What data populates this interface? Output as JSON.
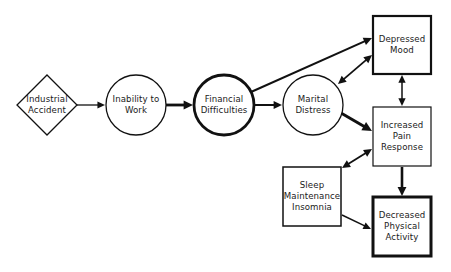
{
  "diagram": {
    "nodes": [
      {
        "id": "industrial-accident",
        "shape": "diamond",
        "lines": [
          "Industrial",
          "Accident"
        ],
        "cx": 47,
        "cy": 105,
        "w": 60,
        "h": 60,
        "stroke": 1.3
      },
      {
        "id": "inability-to-work",
        "shape": "circle",
        "lines": [
          "Inability to",
          "Work"
        ],
        "cx": 136,
        "cy": 105,
        "r": 30,
        "stroke": 1.3
      },
      {
        "id": "financial-difficulties",
        "shape": "circle",
        "lines": [
          "Financial",
          "Difficulties"
        ],
        "cx": 224,
        "cy": 105,
        "r": 30,
        "stroke": 2.8
      },
      {
        "id": "marital-distress",
        "shape": "circle",
        "lines": [
          "Marital",
          "Distress"
        ],
        "cx": 313,
        "cy": 105,
        "r": 30,
        "stroke": 1.3
      },
      {
        "id": "depressed-mood",
        "shape": "box",
        "lines": [
          "Depressed",
          "Mood"
        ],
        "x": 373,
        "y": 16,
        "w": 58,
        "h": 58,
        "stroke": 2.2
      },
      {
        "id": "increased-pain-response",
        "shape": "box",
        "lines": [
          "Increased",
          "Pain",
          "Response"
        ],
        "x": 373,
        "y": 107,
        "w": 58,
        "h": 59,
        "stroke": 1.2
      },
      {
        "id": "sleep-maintenance-insomnia",
        "shape": "box",
        "lines": [
          "Sleep",
          "Maintenance",
          "Insomnia"
        ],
        "x": 283,
        "y": 167,
        "w": 58,
        "h": 59,
        "stroke": 1.5
      },
      {
        "id": "decreased-physical-activity",
        "shape": "box",
        "lines": [
          "Decreased",
          "Physical",
          "Activity"
        ],
        "x": 373,
        "y": 197,
        "w": 58,
        "h": 59,
        "stroke": 3.0
      }
    ],
    "edges": [
      {
        "from": "industrial-accident",
        "to": "inability-to-work",
        "x1": 77,
        "y1": 105,
        "x2": 105,
        "y2": 105,
        "width": 1.3,
        "head": "end"
      },
      {
        "from": "inability-to-work",
        "to": "financial-difficulties",
        "x1": 166,
        "y1": 105,
        "x2": 193,
        "y2": 105,
        "width": 2.8,
        "head": "end"
      },
      {
        "from": "financial-difficulties",
        "to": "marital-distress",
        "x1": 254,
        "y1": 105,
        "x2": 282,
        "y2": 105,
        "width": 2.0,
        "head": "end"
      },
      {
        "from": "financial-difficulties",
        "to": "depressed-mood",
        "x1": 251,
        "y1": 92,
        "x2": 372,
        "y2": 38,
        "width": 2.0,
        "head": "end"
      },
      {
        "from": "marital-distress",
        "to": "depressed-mood",
        "x1": 338,
        "y1": 84,
        "x2": 372,
        "y2": 55,
        "width": 1.8,
        "head": "both"
      },
      {
        "from": "marital-distress",
        "to": "increased-pain-response",
        "x1": 341,
        "y1": 113,
        "x2": 372,
        "y2": 131,
        "width": 3.0,
        "head": "end"
      },
      {
        "from": "depressed-mood",
        "to": "increased-pain-response",
        "x1": 402,
        "y1": 75,
        "x2": 402,
        "y2": 106,
        "width": 1.5,
        "head": "both"
      },
      {
        "from": "increased-pain-response",
        "to": "sleep-maintenance-insomnia",
        "x1": 372,
        "y1": 149,
        "x2": 342,
        "y2": 168,
        "width": 1.8,
        "head": "both"
      },
      {
        "from": "increased-pain-response",
        "to": "decreased-physical-activity",
        "x1": 402,
        "y1": 167,
        "x2": 402,
        "y2": 196,
        "width": 2.6,
        "head": "end"
      },
      {
        "from": "sleep-maintenance-insomnia",
        "to": "decreased-physical-activity",
        "x1": 342,
        "y1": 215,
        "x2": 371,
        "y2": 229,
        "width": 1.4,
        "head": "end"
      }
    ],
    "colors": {
      "stroke": "#111111",
      "text": "#1a1a1a",
      "background": "#ffffff"
    }
  }
}
